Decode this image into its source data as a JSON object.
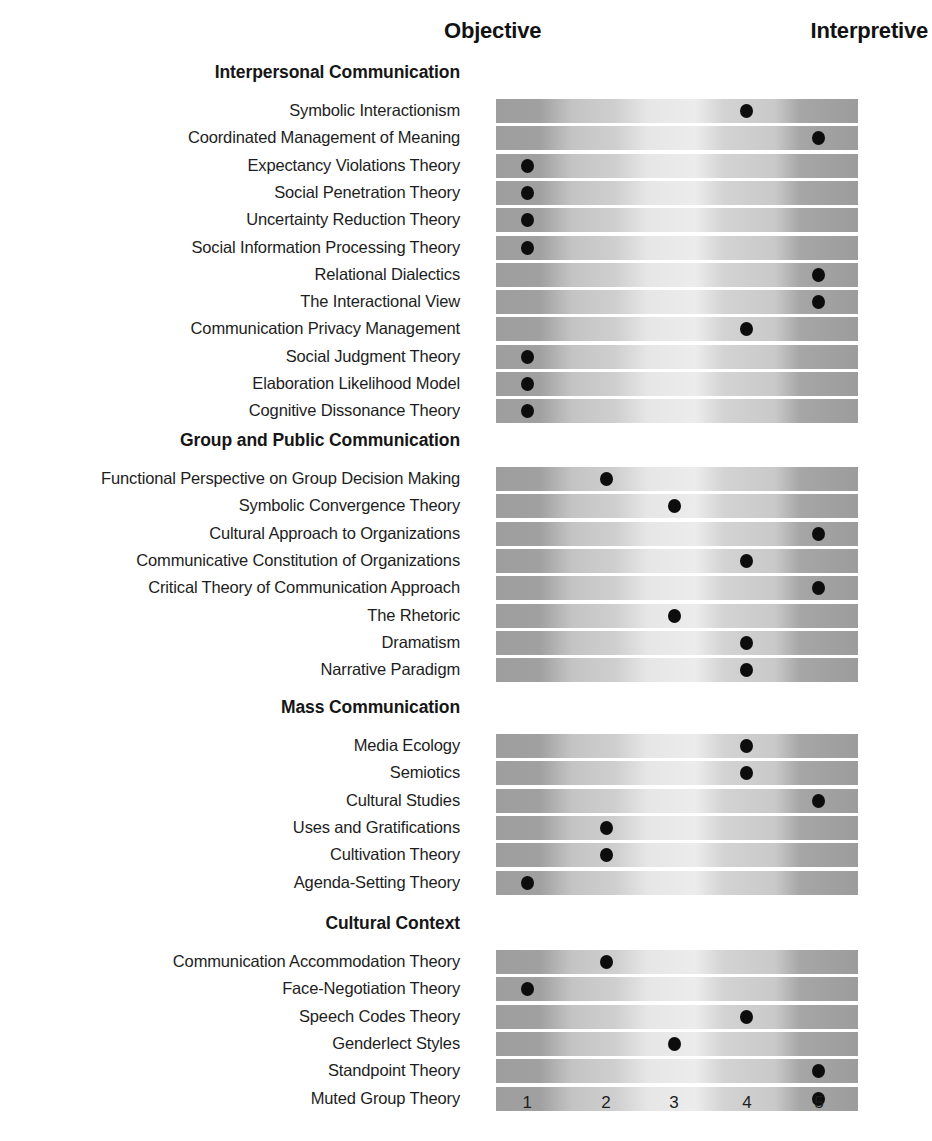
{
  "axis": {
    "left_pole": "Objective",
    "right_pole": "Interpretive",
    "scale_labels": [
      "1",
      "2",
      "3",
      "4",
      "5"
    ],
    "scale_positions_pct": [
      8.6,
      30.4,
      49.2,
      69.3,
      89.2
    ]
  },
  "chart_data": {
    "type": "scatter",
    "title": "",
    "xlabel": "",
    "ylabel": "",
    "xlim": [
      1,
      5
    ],
    "x_tick_labels": [
      "1",
      "2",
      "3",
      "4",
      "5"
    ],
    "left_pole": "Objective",
    "right_pole": "Interpretive",
    "grid": false,
    "legend": "none",
    "groups": [
      {
        "name": "Interpersonal Communication",
        "points": [
          {
            "label": "Symbolic Interactionism",
            "value": 4
          },
          {
            "label": "Coordinated Management of Meaning",
            "value": 5
          },
          {
            "label": "Expectancy Violations Theory",
            "value": 1
          },
          {
            "label": "Social Penetration Theory",
            "value": 1
          },
          {
            "label": "Uncertainty Reduction Theory",
            "value": 1
          },
          {
            "label": "Social Information Processing Theory",
            "value": 1
          },
          {
            "label": "Relational Dialectics",
            "value": 5
          },
          {
            "label": "The Interactional View",
            "value": 5
          },
          {
            "label": "Communication Privacy Management",
            "value": 4
          },
          {
            "label": "Social Judgment Theory",
            "value": 1
          },
          {
            "label": "Elaboration Likelihood Model",
            "value": 1
          },
          {
            "label": "Cognitive Dissonance Theory",
            "value": 1
          }
        ]
      },
      {
        "name": "Group and Public Communication",
        "points": [
          {
            "label": "Functional Perspective on Group Decision Making",
            "value": 2
          },
          {
            "label": "Symbolic Convergence Theory",
            "value": 3
          },
          {
            "label": "Cultural Approach to Organizations",
            "value": 5
          },
          {
            "label": "Communicative Constitution of Organizations",
            "value": 4
          },
          {
            "label": "Critical Theory of Communication Approach",
            "value": 5
          },
          {
            "label": "The Rhetoric",
            "value": 3
          },
          {
            "label": "Dramatism",
            "value": 4
          },
          {
            "label": "Narrative Paradigm",
            "value": 4
          }
        ]
      },
      {
        "name": "Mass Communication",
        "points": [
          {
            "label": "Media Ecology",
            "value": 4
          },
          {
            "label": "Semiotics",
            "value": 4
          },
          {
            "label": "Cultural Studies",
            "value": 5
          },
          {
            "label": "Uses and Gratifications",
            "value": 2
          },
          {
            "label": "Cultivation Theory",
            "value": 2
          },
          {
            "label": "Agenda-Setting Theory",
            "value": 1
          }
        ]
      },
      {
        "name": "Cultural Context",
        "points": [
          {
            "label": "Communication Accommodation Theory",
            "value": 2
          },
          {
            "label": "Face-Negotiation Theory",
            "value": 1
          },
          {
            "label": "Speech Codes Theory",
            "value": 4
          },
          {
            "label": "Genderlect Styles",
            "value": 3
          },
          {
            "label": "Standpoint Theory",
            "value": 5
          },
          {
            "label": "Muted Group Theory",
            "value": 5
          }
        ]
      }
    ]
  },
  "colors": {
    "dot": "#0d0d0d",
    "text": "#1d1d1d",
    "band_dark": "#9e9e9e",
    "band_light": "#ececec",
    "background": "#ffffff"
  }
}
